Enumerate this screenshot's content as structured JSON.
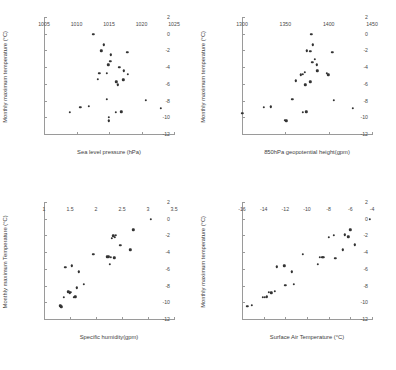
{
  "figure": {
    "title": "",
    "background": "#ffffff",
    "marker_color": "#333333",
    "axis_color": "#9a9a9a",
    "layout": "2x2 grid of scatter panels"
  },
  "chart_data": [
    {
      "type": "scatter",
      "panel": "top-left",
      "title": "",
      "xlabel": "Sea level pressure (hPa)",
      "ylabel": "Monthly maximum temperature (°C)",
      "xlim": [
        1005,
        1025
      ],
      "ylim": [
        -12,
        2
      ],
      "xticks": [
        1005,
        1010,
        1015,
        1020,
        1025
      ],
      "yticks": [
        2,
        0,
        -2,
        -4,
        -6,
        -8,
        -10,
        -12
      ],
      "xtick_labels": [
        "1005",
        "1010",
        "1015",
        "1020",
        "1025"
      ],
      "ytick_labels": [
        "2",
        "0",
        "-2",
        "-4",
        "-6",
        "-8",
        "-10",
        "-12"
      ],
      "grid": false,
      "legend": null,
      "points": [
        [
          1012.6,
          0.05
        ],
        [
          1014.2,
          -1.2
        ],
        [
          1013.8,
          -1.9
        ],
        [
          1017.8,
          -2.1
        ],
        [
          1015.3,
          -2.4
        ],
        [
          1015.2,
          -3.2
        ],
        [
          1014.9,
          -3.6
        ],
        [
          1016.6,
          -3.9
        ],
        [
          1013.5,
          -4.6
        ],
        [
          1014.7,
          -4.6
        ],
        [
          1017.3,
          -4.3
        ],
        [
          1017.9,
          -4.7
        ],
        [
          1013.3,
          -5.3
        ],
        [
          1016.1,
          -5.6
        ],
        [
          1017.2,
          -5.4
        ],
        [
          1016.4,
          -6.0
        ],
        [
          1014.7,
          -7.7
        ],
        [
          1020.7,
          -7.85
        ],
        [
          1009.0,
          -9.3
        ],
        [
          1010.6,
          -8.7
        ],
        [
          1011.9,
          -8.55
        ],
        [
          1023.0,
          -8.8
        ],
        [
          1016.0,
          -9.3
        ],
        [
          1016.9,
          -9.2
        ],
        [
          1015.0,
          -9.9
        ],
        [
          1015.0,
          -10.3
        ]
      ]
    },
    {
      "type": "scatter",
      "panel": "top-right",
      "title": "",
      "xlabel": "850hPa geopotential height(gpm)",
      "ylabel": "Monthly maximum temperature (°C)",
      "xlim": [
        1300,
        1450
      ],
      "ylim": [
        -12,
        2
      ],
      "xticks": [
        1300,
        1350,
        1400,
        1450
      ],
      "yticks": [
        2,
        0,
        -2,
        -4,
        -6,
        -8,
        -10,
        -12
      ],
      "xtick_labels": [
        "1300",
        "1350",
        "1400",
        "1450"
      ],
      "ytick_labels": [
        "2",
        "0",
        "-2",
        "-4",
        "-6",
        "-8",
        "-10",
        "-12"
      ],
      "grid": false,
      "legend": null,
      "points": [
        [
          1380.0,
          0.05
        ],
        [
          1382.0,
          -1.2
        ],
        [
          1375.0,
          -1.9
        ],
        [
          1379.0,
          -2.0
        ],
        [
          1404.0,
          -2.1
        ],
        [
          1384.0,
          -2.9
        ],
        [
          1381.0,
          -3.3
        ],
        [
          1386.0,
          -3.6
        ],
        [
          1387.0,
          -4.3
        ],
        [
          1372.5,
          -4.5
        ],
        [
          1370.5,
          -4.7
        ],
        [
          1367.5,
          -4.8
        ],
        [
          1398.0,
          -4.6
        ],
        [
          1399.5,
          -4.8
        ],
        [
          1362.0,
          -5.5
        ],
        [
          1379.0,
          -5.6
        ],
        [
          1373.0,
          -6.0
        ],
        [
          1358.0,
          -7.7
        ],
        [
          1406.0,
          -7.85
        ],
        [
          1325.0,
          -8.7
        ],
        [
          1333.0,
          -8.6
        ],
        [
          1428.0,
          -8.8
        ],
        [
          1370.0,
          -9.3
        ],
        [
          1374.0,
          -9.2
        ],
        [
          1300.5,
          -9.4
        ],
        [
          1349.5,
          -10.2
        ],
        [
          1351.0,
          -10.3
        ]
      ]
    },
    {
      "type": "scatter",
      "panel": "bottom-left",
      "title": "",
      "xlabel": "Specific humidity(gpm)",
      "ylabel": "Monthly maximum Temperature (°C)",
      "xlim": [
        1,
        3.5
      ],
      "ylim": [
        -12,
        2
      ],
      "xticks": [
        1,
        1.5,
        2,
        2.5,
        3,
        3.5
      ],
      "yticks": [
        2,
        0,
        -2,
        -4,
        -6,
        -8,
        -10,
        -12
      ],
      "xtick_labels": [
        "1",
        "1.5",
        "2",
        "2.5",
        "3",
        "3.5"
      ],
      "ytick_labels": [
        "2",
        "0",
        "-2",
        "-4",
        "-6",
        "-8",
        "-10",
        "-12"
      ],
      "grid": false,
      "legend": null,
      "points": [
        [
          3.05,
          0.05
        ],
        [
          2.72,
          -1.2
        ],
        [
          2.33,
          -1.9
        ],
        [
          2.38,
          -1.85
        ],
        [
          2.3,
          -2.2
        ],
        [
          2.36,
          -2.1
        ],
        [
          2.47,
          -3.05
        ],
        [
          2.66,
          -3.6
        ],
        [
          1.95,
          -4.1
        ],
        [
          2.22,
          -4.4
        ],
        [
          2.25,
          -4.4
        ],
        [
          2.28,
          -4.5
        ],
        [
          2.35,
          -4.55
        ],
        [
          2.27,
          -5.35
        ],
        [
          1.41,
          -5.65
        ],
        [
          1.53,
          -5.5
        ],
        [
          1.67,
          -6.2
        ],
        [
          1.77,
          -7.75
        ],
        [
          1.63,
          -8.15
        ],
        [
          1.47,
          -8.6
        ],
        [
          1.5,
          -8.75
        ],
        [
          1.52,
          -8.7
        ],
        [
          1.38,
          -9.25
        ],
        [
          1.57,
          -9.3
        ],
        [
          1.6,
          -9.2
        ],
        [
          1.31,
          -10.3
        ],
        [
          1.33,
          -10.4
        ]
      ]
    },
    {
      "type": "scatter",
      "panel": "bottom-right",
      "title": "",
      "xlabel": "Surface Air Temperature (°C)",
      "ylabel": "Monthly maximum temperature (°C)",
      "xlim": [
        -16,
        -4
      ],
      "ylim": [
        -12,
        2
      ],
      "xticks": [
        -16,
        -14,
        -12,
        -10,
        -8,
        -6,
        -4
      ],
      "yticks": [
        2,
        0,
        -2,
        -4,
        -6,
        -8,
        -10,
        -12
      ],
      "xtick_labels": [
        "-16",
        "-14",
        "-12",
        "-10",
        "-8",
        "-6",
        "-4"
      ],
      "ytick_labels": [
        "2",
        "0",
        "-2",
        "-4",
        "-6",
        "-8",
        "-10",
        "-12"
      ],
      "grid": false,
      "legend": null,
      "points": [
        [
          -4.2,
          0.05
        ],
        [
          -6.0,
          -1.2
        ],
        [
          -7.5,
          -1.85
        ],
        [
          -6.5,
          -1.8
        ],
        [
          -8.0,
          -2.1
        ],
        [
          -6.2,
          -2.05
        ],
        [
          -5.6,
          -3.0
        ],
        [
          -6.7,
          -3.6
        ],
        [
          -10.4,
          -4.1
        ],
        [
          -8.8,
          -4.5
        ],
        [
          -8.6,
          -4.5
        ],
        [
          -8.5,
          -4.45
        ],
        [
          -7.4,
          -4.6
        ],
        [
          -9.0,
          -5.35
        ],
        [
          -12.8,
          -5.6
        ],
        [
          -12.1,
          -5.5
        ],
        [
          -11.4,
          -6.2
        ],
        [
          -11.2,
          -7.75
        ],
        [
          -12.0,
          -7.8
        ],
        [
          -13.0,
          -8.55
        ],
        [
          -13.5,
          -8.7
        ],
        [
          -13.3,
          -8.75
        ],
        [
          -14.1,
          -9.3
        ],
        [
          -13.7,
          -9.2
        ],
        [
          -13.9,
          -9.25
        ],
        [
          -15.5,
          -10.35
        ],
        [
          -15.1,
          -10.2
        ]
      ]
    }
  ]
}
